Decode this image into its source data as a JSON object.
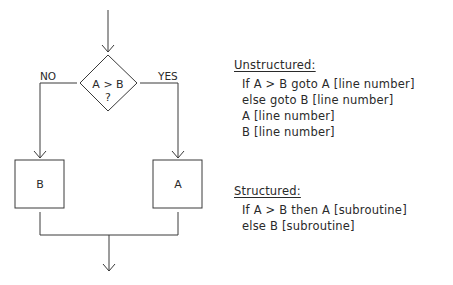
{
  "flowchart": {
    "decision": {
      "line1": "A > B",
      "line2": "?"
    },
    "branch_no_label": "NO",
    "branch_yes_label": "YES",
    "box_left_label": "B",
    "box_right_label": "A",
    "stroke_color": "#3a3a3a"
  },
  "unstructured": {
    "heading": "Unstructured:",
    "lines": [
      "If A > B goto A [line number]",
      "else goto B [line number]",
      "A [line number]",
      "B [line number]"
    ]
  },
  "structured": {
    "heading": "Structured:",
    "lines": [
      "If A > B then A [subroutine]",
      "else B [subroutine]"
    ]
  }
}
